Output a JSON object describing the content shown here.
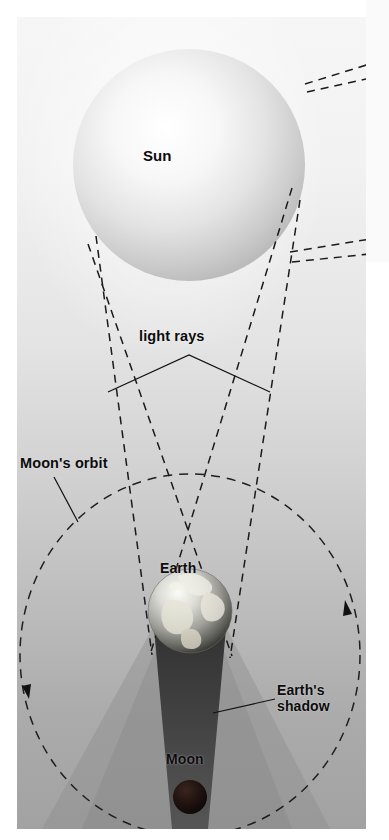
{
  "diagram": {
    "type": "astronomy-diagram",
    "labels": {
      "sun": "Sun",
      "light_rays": "light rays",
      "moons_orbit": "Moon's orbit",
      "earth": "Earth",
      "earths_shadow": "Earth's\nshadow",
      "earths_shadow_line1": "Earth's",
      "earths_shadow_line2": "shadow",
      "moon": "Moon"
    },
    "colors": {
      "background_top": "#f6f6f6",
      "background_bottom": "#a2a2a2",
      "label_text": "#0b0b0b",
      "ray_line": "#1a1a1a",
      "orbit_line": "#1f1f1f",
      "umbra": "#2b2b2b",
      "penumbra": "#8f8f8f",
      "moon_body": "#140d0a",
      "page": "#ffffff"
    },
    "bodies": [
      {
        "name": "Sun",
        "cx": 189,
        "cy": 165,
        "r": 116,
        "shading": "radial-light-upper-left"
      },
      {
        "name": "Earth",
        "cx": 190,
        "cy": 611,
        "r": 42,
        "shading": "globe-continents"
      },
      {
        "name": "Moon",
        "cx": 190,
        "cy": 797,
        "r": 17,
        "shading": "dark-eclipsed"
      }
    ],
    "orbit": {
      "cx": 190,
      "cy": 655,
      "rx": 170,
      "ry": 181,
      "style": "dashed",
      "direction_arrows": 2
    },
    "rays": {
      "count": 4,
      "style": "dashed",
      "origin": "Sun limbs",
      "converge_at": "Earth"
    }
  }
}
